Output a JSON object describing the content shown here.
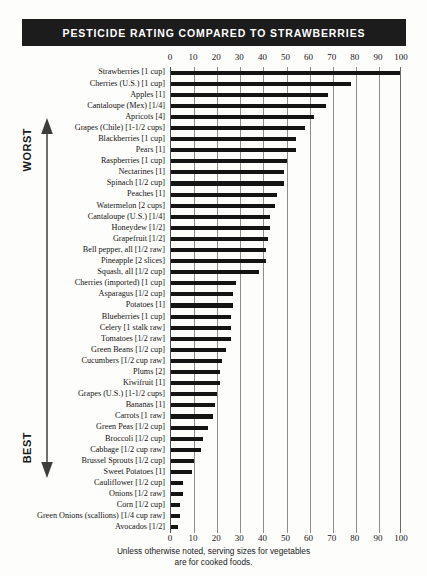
{
  "title": "PESTICIDE RATING COMPARED TO STRAWBERRIES",
  "scale": {
    "worst_label": "WORST",
    "best_label": "BEST"
  },
  "footer": {
    "line1": "Unless otherwise noted, serving sizes for vegetables",
    "line2": "are for cooked foods."
  },
  "chart_data": {
    "type": "bar",
    "orientation": "horizontal",
    "title": "PESTICIDE RATING COMPARED TO STRAWBERRIES",
    "xlabel": "",
    "ylabel": "",
    "xlim": [
      0,
      100
    ],
    "grid": true,
    "legend": "none",
    "tick_labels": [
      "0",
      "10",
      "20",
      "30",
      "40",
      "50",
      "60",
      "70",
      "80",
      "90",
      "100"
    ],
    "ticks": [
      0,
      10,
      20,
      30,
      40,
      50,
      60,
      70,
      80,
      90,
      100
    ],
    "categories": [
      "Strawberries [1 cup]",
      "Cherries (U.S.) [1 cup]",
      "Apples [1]",
      "Cantaloupe (Mex) [1/4]",
      "Apricots [4]",
      "Grapes (Chile) [1-1/2 cups]",
      "Blackberries [1 cup]",
      "Pears [1]",
      "Raspberries [1 cup]",
      "Nectarines [1]",
      "Spinach [1/2 cup]",
      "Peaches [1]",
      "Watermelon [2 cups]",
      "Cantaloupe (U.S.) [1/4]",
      "Honeydew [1/2]",
      "Grapefruit [1/2]",
      "Bell pepper, all [1/2 raw]",
      "Pineapple [2 slices]",
      "Squash, all [1/2 cup]",
      "Cherries (imported) [1 cup]",
      "Asparagus [1/2 cup]",
      "Potatoes [1]",
      "Blueberries [1 cup]",
      "Celery [1 stalk raw]",
      "Tomatoes [1/2 raw]",
      "Green Beans [1/2 cup]",
      "Cucumbers [1/2 cup raw]",
      "Plums [2]",
      "Kiwifruit [1]",
      "Grapes (U.S.) [1-1/2 cups]",
      "Bananas [1]",
      "Carrots [1 raw]",
      "Green Peas [1/2 cup]",
      "Broccoli [1/2 cup]",
      "Cabbage [1/2 cup raw]",
      "Brussel Sprouts [1/2 cup]",
      "Sweet Potatoes [1]",
      "Cauliflower [1/2 cup]",
      "Onions [1/2 raw]",
      "Corn [1/2 cup]",
      "Green Onions (scallions) [1/4 cup raw]",
      "Avocados [1/2]"
    ],
    "values": [
      100,
      78,
      68,
      67,
      62,
      58,
      54,
      54,
      50,
      49,
      49,
      46,
      45,
      43,
      43,
      42,
      41,
      41,
      38,
      28,
      27,
      27,
      26,
      26,
      26,
      24,
      22,
      21,
      21,
      20,
      19,
      18,
      16,
      14,
      13,
      10,
      9,
      5,
      5,
      4,
      4,
      3
    ]
  }
}
